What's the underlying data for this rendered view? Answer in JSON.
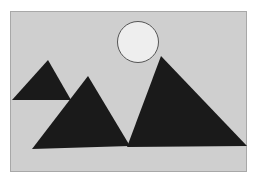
{
  "image": {
    "semantic": "image-placeholder-icon",
    "description": "Landscape placeholder: mountains and sun",
    "colors": {
      "background": "#ffffff",
      "frame_fill": "#cfcfcf",
      "frame_stroke": "#a8a8a8",
      "mountain_fill": "#1a1a1a",
      "sun_fill": "#eeeeee",
      "sun_stroke": "#555555"
    }
  }
}
